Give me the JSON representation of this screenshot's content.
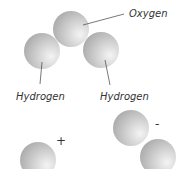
{
  "diagram": {
    "type": "water-molecule-ions",
    "atoms": [
      {
        "id": "oxygen",
        "label": "Oxygen"
      },
      {
        "id": "hydrogen-left",
        "label": "Hydrogen"
      },
      {
        "id": "hydrogen-right",
        "label": "Hydrogen"
      }
    ],
    "ions": [
      {
        "id": "hydrogen-ion",
        "sign": "+",
        "atom_count": 1
      },
      {
        "id": "hydroxide-ion",
        "sign": "-",
        "atom_count": 2
      }
    ],
    "colors": {
      "sphere_light": "#f2f2f2",
      "sphere_dark": "#a8a8a8",
      "text": "#333333",
      "leader": "#555555"
    }
  }
}
